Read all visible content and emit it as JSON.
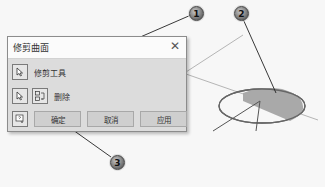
{
  "dialog": {
    "title": "修剪曲面",
    "close_icon": "close-icon",
    "rows": [
      {
        "icons": [
          "pointer-select-icon"
        ],
        "label": "修剪工具"
      },
      {
        "icons": [
          "pointer-select-icon",
          "swap-icon"
        ],
        "label": "删除"
      }
    ],
    "help_icon": "help-icon",
    "buttons": {
      "ok": "确定",
      "cancel": "取消",
      "apply": "应用"
    }
  },
  "callouts": [
    {
      "number": "1",
      "target": "trim-tool"
    },
    {
      "number": "2",
      "target": "surface-region"
    },
    {
      "number": "3",
      "target": "ok-button"
    }
  ],
  "colors": {
    "dialog_body": "#dcdcdc",
    "title_bar": "#fbfbfb",
    "ellipse_fill": "#a9a9a9"
  }
}
